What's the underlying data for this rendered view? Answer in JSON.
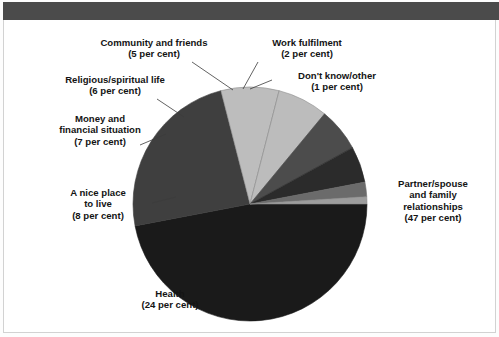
{
  "page": {
    "background_color": "#ffffff",
    "frame_border_color": "#d2d2d2",
    "header_bar_color": "#4b4b4b"
  },
  "chart_data": {
    "type": "pie",
    "title": "",
    "subtitle": "",
    "xlabel": "",
    "ylabel": "",
    "legend_position": "callout-labels",
    "grid": false,
    "units": "per cent",
    "start_angle_deg": 0,
    "direction": "clockwise",
    "categories": [
      "Partner/spouse and family relationships",
      "Health",
      "A nice place to live",
      "Money and financial situation",
      "Religious/spiritual life",
      "Community and friends",
      "Work fulfilment",
      "Don't know/other"
    ],
    "values": [
      47,
      24,
      8,
      7,
      6,
      5,
      2,
      1
    ],
    "slices": [
      {
        "id": "partner",
        "label_lines": [
          "Partner/spouse",
          "and family",
          "relationships",
          "(47 per cent)"
        ],
        "value": 47,
        "value_text": "(47 per cent)",
        "color": "#1a1a1a"
      },
      {
        "id": "health",
        "label_lines": [
          "Health",
          "(24 per cent)"
        ],
        "value": 24,
        "value_text": "(24 per cent)",
        "color": "#3f3f3f"
      },
      {
        "id": "nice-place",
        "label_lines": [
          "A nice place",
          "to live",
          "(8 per cent)"
        ],
        "value": 8,
        "value_text": "(8 per cent)",
        "color": "#bdbdbd"
      },
      {
        "id": "money",
        "label_lines": [
          "Money and",
          "financial situation",
          "(7 per cent)"
        ],
        "value": 7,
        "value_text": "(7 per cent)",
        "color": "#bcbcbc"
      },
      {
        "id": "religious",
        "label_lines": [
          "Religious/spiritual life",
          "(6 per cent)"
        ],
        "value": 6,
        "value_text": "(6 per cent)",
        "color": "#4c4c4c"
      },
      {
        "id": "community",
        "label_lines": [
          "Community and friends",
          "(5 per cent)"
        ],
        "value": 5,
        "value_text": "(5 per cent)",
        "color": "#2b2b2b"
      },
      {
        "id": "work",
        "label_lines": [
          "Work fulfilment",
          "(2 per cent)"
        ],
        "value": 2,
        "value_text": "(2 per cent)",
        "color": "#6b6b6b"
      },
      {
        "id": "dontknow",
        "label_lines": [
          "Don't know/other",
          "(1 per cent)"
        ],
        "value": 1,
        "value_text": "(1 per cent)",
        "color": "#9d9d9d"
      }
    ]
  },
  "labels": {
    "community": {
      "l1": "Community and friends",
      "l2": "(5 per cent)"
    },
    "work": {
      "l1": "Work fulfilment",
      "l2": "(2 per cent)"
    },
    "dontknow": {
      "l1": "Don't know/other",
      "l2": "(1 per cent)"
    },
    "religious": {
      "l1": "Religious/spiritual life",
      "l2": "(6 per cent)"
    },
    "money": {
      "l1": "Money and",
      "l2": "financial situation",
      "l3": "(7 per cent)"
    },
    "nice": {
      "l1": "A nice place",
      "l2": "to live",
      "l3": "(8 per cent)"
    },
    "health": {
      "l1": "Health",
      "l2": "(24 per cent)"
    },
    "partner": {
      "l1": "Partner/spouse",
      "l2": "and family",
      "l3": "relationships",
      "l4": "(47 per cent)"
    }
  }
}
